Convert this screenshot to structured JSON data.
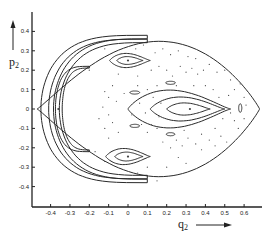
{
  "chart_data": {
    "type": "scatter",
    "title": "",
    "xlabel": "q2",
    "ylabel": "p2",
    "xlim": [
      -0.5,
      0.7
    ],
    "ylim": [
      -0.5,
      0.5
    ],
    "xticks": [
      "-0.4",
      "-0.3",
      "-0.2",
      "-0.1",
      "0",
      "0.1",
      "0.2",
      "0.3",
      "0.4",
      "0.5",
      "0.6"
    ],
    "xtick_values": [
      -0.4,
      -0.3,
      -0.2,
      -0.1,
      0,
      0.1,
      0.2,
      0.3,
      0.4,
      0.5,
      0.6
    ],
    "yticks": [
      "0.4",
      "0.3",
      "0.2",
      "0.1",
      "0",
      "-0.1",
      "-0.2",
      "-0.3",
      "-0.4"
    ],
    "ytick_values": [
      0.4,
      0.3,
      0.2,
      0.1,
      0,
      -0.1,
      -0.2,
      -0.3,
      -0.4
    ],
    "grid": false,
    "legend": "none",
    "fixed_points": [
      {
        "name": "central-island-center",
        "q": 0.32,
        "p": 0.0
      },
      {
        "name": "upper-island-center",
        "q": 0.0,
        "p": 0.25
      },
      {
        "name": "lower-island-center",
        "q": 0.0,
        "p": -0.245
      },
      {
        "name": "left-crescent-point",
        "q": -0.36,
        "p": 0.0
      }
    ],
    "closed_orbits": [
      {
        "name": "outer-boundary",
        "kind": "teardrop",
        "q_left": -0.47,
        "q_right": 0.68,
        "p_half": 0.48,
        "q_peak": 0.05
      },
      {
        "name": "central-island-outer",
        "kind": "egg",
        "cq": 0.33,
        "cp": 0.0,
        "q_left": 0.0,
        "q_right": 0.53,
        "p_half": 0.115
      },
      {
        "name": "central-island-middle",
        "kind": "egg",
        "cq": 0.33,
        "cp": 0.0,
        "q_left": 0.115,
        "q_right": 0.5,
        "p_half": 0.073
      },
      {
        "name": "central-island-inner",
        "kind": "egg",
        "cq": 0.33,
        "cp": 0.0,
        "q_left": 0.2,
        "q_right": 0.425,
        "p_half": 0.037
      },
      {
        "name": "upper-island-outer",
        "kind": "egg",
        "cq": 0.0,
        "cp": 0.25,
        "q_left": -0.095,
        "q_right": 0.115,
        "p_half": 0.043
      },
      {
        "name": "upper-island-inner",
        "kind": "egg",
        "cq": 0.0,
        "cp": 0.25,
        "q_left": -0.058,
        "q_right": 0.078,
        "p_half": 0.024
      },
      {
        "name": "lower-island-outer",
        "kind": "egg",
        "cq": 0.0,
        "cp": -0.245,
        "q_left": -0.115,
        "q_right": 0.115,
        "p_half": 0.049
      },
      {
        "name": "lower-island-inner",
        "kind": "egg",
        "cq": 0.0,
        "cp": -0.245,
        "q_left": -0.068,
        "q_right": 0.078,
        "p_half": 0.027
      },
      {
        "name": "small-island-right",
        "kind": "ellipse",
        "cq": 0.58,
        "cp": 0.005,
        "rq": 0.008,
        "rp": 0.022
      },
      {
        "name": "small-island-upper-right",
        "kind": "ellipse",
        "cq": 0.22,
        "cp": 0.135,
        "rq": 0.025,
        "rp": 0.008
      },
      {
        "name": "small-island-lower-right",
        "kind": "ellipse",
        "cq": 0.22,
        "cp": -0.13,
        "rq": 0.022,
        "rp": 0.008
      },
      {
        "name": "small-island-upper-left",
        "kind": "ellipse",
        "cq": 0.035,
        "cp": 0.085,
        "rq": 0.025,
        "rp": 0.008
      },
      {
        "name": "small-island-lower-left",
        "kind": "ellipse",
        "cq": 0.035,
        "cp": -0.087,
        "rq": 0.025,
        "rp": 0.008
      }
    ],
    "crescents": [
      {
        "name": "crescent-outer",
        "q_tip": 0.1,
        "p_tip": 0.38,
        "q_back": -0.45,
        "outer_width": 0.06,
        "thickness": 0.065
      },
      {
        "name": "crescent-middle",
        "q_tip": 0.1,
        "p_tip": 0.36,
        "q_back": -0.41,
        "outer_width": 0.06,
        "thickness": 0.055
      },
      {
        "name": "crescent-inner",
        "q_tip": -0.2,
        "p_tip": 0.22,
        "q_back": -0.375,
        "outer_width": 0.03,
        "thickness": 0.035
      }
    ],
    "chaotic_points": [
      [
        0.04,
        0.31
      ],
      [
        0.08,
        0.33
      ],
      [
        0.14,
        0.29
      ],
      [
        0.18,
        0.31
      ],
      [
        0.22,
        0.28
      ],
      [
        0.26,
        0.3
      ],
      [
        0.31,
        0.27
      ],
      [
        0.35,
        0.26
      ],
      [
        -0.12,
        0.31
      ],
      [
        -0.05,
        0.18
      ],
      [
        0.05,
        0.17
      ],
      [
        0.12,
        0.2
      ],
      [
        0.16,
        0.22
      ],
      [
        0.2,
        0.2
      ],
      [
        0.23,
        0.17
      ],
      [
        0.27,
        0.22
      ],
      [
        0.3,
        0.19
      ],
      [
        0.33,
        0.21
      ],
      [
        0.36,
        0.18
      ],
      [
        0.39,
        0.2
      ],
      [
        0.42,
        0.23
      ],
      [
        0.46,
        0.19
      ],
      [
        0.5,
        0.2
      ],
      [
        0.53,
        0.15
      ],
      [
        0.55,
        0.1
      ],
      [
        0.58,
        0.13
      ],
      [
        0.6,
        0.06
      ],
      [
        0.61,
        0.02
      ],
      [
        0.6,
        -0.05
      ],
      [
        0.57,
        -0.1
      ],
      [
        0.55,
        -0.06
      ],
      [
        0.52,
        0.07
      ],
      [
        -0.08,
        0.12
      ],
      [
        -0.1,
        0.06
      ],
      [
        -0.12,
        0.09
      ],
      [
        -0.06,
        0.04
      ],
      [
        -0.13,
        0.01
      ],
      [
        -0.1,
        -0.03
      ],
      [
        -0.15,
        -0.05
      ],
      [
        -0.08,
        -0.07
      ],
      [
        -0.12,
        -0.1
      ],
      [
        -0.05,
        -0.12
      ],
      [
        -0.1,
        -0.15
      ],
      [
        0.02,
        -0.03
      ],
      [
        0.06,
        0.03
      ],
      [
        0.09,
        -0.02
      ],
      [
        0.05,
        0.12
      ],
      [
        0.1,
        0.1
      ],
      [
        0.13,
        0.06
      ],
      [
        0.15,
        0.12
      ],
      [
        0.12,
        -0.08
      ],
      [
        0.1,
        -0.12
      ],
      [
        0.15,
        -0.1
      ],
      [
        0.18,
        -0.17
      ],
      [
        0.22,
        -0.2
      ],
      [
        0.25,
        -0.16
      ],
      [
        0.28,
        -0.19
      ],
      [
        0.31,
        -0.15
      ],
      [
        0.35,
        -0.18
      ],
      [
        0.38,
        -0.21
      ],
      [
        0.42,
        -0.16
      ],
      [
        0.45,
        -0.19
      ],
      [
        0.48,
        -0.14
      ],
      [
        0.51,
        -0.17
      ],
      [
        0.26,
        -0.25
      ],
      [
        0.3,
        -0.28
      ],
      [
        0.2,
        -0.3
      ],
      [
        0.1,
        -0.3
      ],
      [
        0.05,
        -0.33
      ],
      [
        0.15,
        -0.37
      ],
      [
        -0.12,
        -0.27
      ],
      [
        0.34,
        0.12
      ],
      [
        0.4,
        0.12
      ],
      [
        0.44,
        0.1
      ],
      [
        0.45,
        -0.1
      ],
      [
        0.38,
        -0.13
      ],
      [
        -0.02,
        0.08
      ],
      [
        0.17,
        0.03
      ],
      [
        0.16,
        -0.04
      ],
      [
        0.07,
        -0.08
      ],
      [
        -0.2,
        0.2
      ],
      [
        -0.17,
        -0.22
      ],
      [
        0.25,
        0.12
      ],
      [
        0.29,
        -0.11
      ],
      [
        0.47,
        0.06
      ],
      [
        0.49,
        -0.05
      ],
      [
        0.53,
        -0.02
      ]
    ]
  }
}
